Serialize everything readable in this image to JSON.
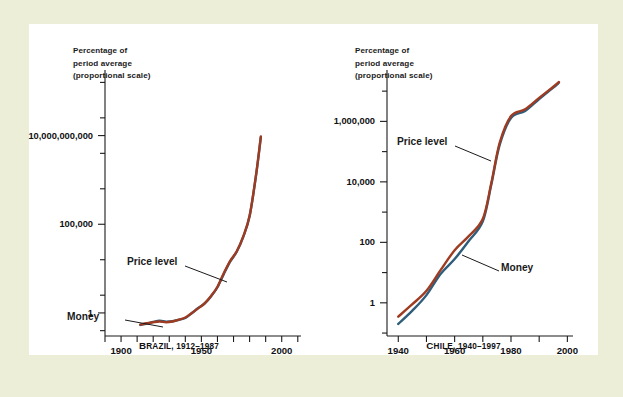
{
  "figure": {
    "background_outer": "#edeed7",
    "background_panel": "#ffffff"
  },
  "chart_data": [
    {
      "type": "line",
      "title": "Brazil, 1912–1987",
      "caption_small_caps": "B",
      "caption_rest": "RAZIL, 1912–1987",
      "axis_header_line1": "Percentage of",
      "axis_header_line2": "period average",
      "axis_header_line3": "(proportional scale)",
      "xlabel": "",
      "ylabel": "Percentage of period average (proportional scale)",
      "yscale": "log",
      "ylim": [
        0.05,
        50000000000000
      ],
      "xlim": [
        1890,
        2012
      ],
      "grid": false,
      "legend": "inline-annotations",
      "yticks_major": [
        1,
        100000,
        10000000000
      ],
      "ytick_labels": [
        "1",
        "100,000",
        "10,000,000,000"
      ],
      "yticks_minor_decades": [
        0.1,
        10,
        1000,
        10000000,
        1000000000,
        100000000000,
        10000000000000
      ],
      "xticks": [
        1890,
        1900,
        1910,
        1920,
        1930,
        1940,
        1950,
        1960,
        1970,
        1980,
        1990,
        2000,
        2010
      ],
      "xtick_labels": [
        {
          "value": 1900,
          "label": "1900"
        },
        {
          "value": 1950,
          "label": "1950"
        },
        {
          "value": 2000,
          "label": "2000"
        }
      ],
      "annotations": [
        {
          "text": "Price level",
          "target_series": "Price level"
        },
        {
          "text": "Money",
          "target_series": "Money"
        }
      ],
      "series": [
        {
          "name": "Price level",
          "color": "#9e3b21",
          "x": [
            1912,
            1916,
            1920,
            1924,
            1928,
            1932,
            1936,
            1940,
            1944,
            1948,
            1952,
            1956,
            1960,
            1964,
            1968,
            1972,
            1976,
            1980,
            1984,
            1987
          ],
          "y": [
            0.22,
            0.26,
            0.3,
            0.33,
            0.3,
            0.33,
            0.42,
            0.55,
            1.0,
            1.8,
            3.5,
            9,
            30,
            180,
            900,
            3000,
            20000,
            300000,
            60000000,
            9000000000
          ]
        },
        {
          "name": "Money",
          "color": "#2f5d7c",
          "x": [
            1912,
            1916,
            1920,
            1924,
            1928,
            1932,
            1936,
            1940,
            1944,
            1948,
            1952,
            1956,
            1960,
            1964,
            1968,
            1972,
            1976,
            1980,
            1984,
            1987
          ],
          "y": [
            0.21,
            0.25,
            0.31,
            0.36,
            0.32,
            0.34,
            0.41,
            0.52,
            0.95,
            1.9,
            3.4,
            8.5,
            28,
            160,
            800,
            2800,
            19000,
            280000,
            55000000,
            8000000000
          ]
        }
      ]
    },
    {
      "type": "line",
      "title": "Chile, 1940–1997",
      "caption_small_caps": "C",
      "caption_rest": "HILE, 1940–1997",
      "axis_header_line1": "Percentage of",
      "axis_header_line2": "period average",
      "axis_header_line3": "(proportional scale)",
      "xlabel": "",
      "ylabel": "Percentage of period average (proportional scale)",
      "yscale": "log",
      "ylim": [
        0.08,
        50000000
      ],
      "xlim": [
        1936,
        2002
      ],
      "grid": false,
      "legend": "inline-annotations",
      "yticks_major": [
        1,
        100,
        10000,
        1000000
      ],
      "ytick_labels": [
        "1",
        "100",
        "10,000",
        "1,000,000"
      ],
      "yticks_minor_decades": [
        0.1,
        10,
        1000,
        100000,
        10000000
      ],
      "xticks": [
        1940,
        1950,
        1960,
        1970,
        1980,
        1990,
        2000
      ],
      "xtick_labels": [
        {
          "value": 1940,
          "label": "1940"
        },
        {
          "value": 1960,
          "label": "1960"
        },
        {
          "value": 1980,
          "label": "1980"
        },
        {
          "value": 2000,
          "label": "2000"
        }
      ],
      "annotations": [
        {
          "text": "Price level",
          "target_series": "Price level"
        },
        {
          "text": "Money",
          "target_series": "Money"
        }
      ],
      "series": [
        {
          "name": "Price level",
          "color": "#9e3b21",
          "x": [
            1940,
            1945,
            1950,
            1955,
            1960,
            1965,
            1970,
            1973,
            1976,
            1980,
            1985,
            1990,
            1995,
            1997
          ],
          "y": [
            0.35,
            0.9,
            2.5,
            12,
            55,
            160,
            600,
            9000,
            200000,
            1500000,
            2500000,
            6000000,
            14000000,
            20000000
          ]
        },
        {
          "name": "Money",
          "color": "#2f5d7c",
          "x": [
            1940,
            1945,
            1950,
            1955,
            1960,
            1965,
            1970,
            1973,
            1976,
            1980,
            1985,
            1990,
            1995,
            1997
          ],
          "y": [
            0.2,
            0.55,
            1.8,
            9,
            28,
            110,
            500,
            8000,
            170000,
            1300000,
            2200000,
            5500000,
            13000000,
            19000000
          ]
        }
      ]
    }
  ]
}
